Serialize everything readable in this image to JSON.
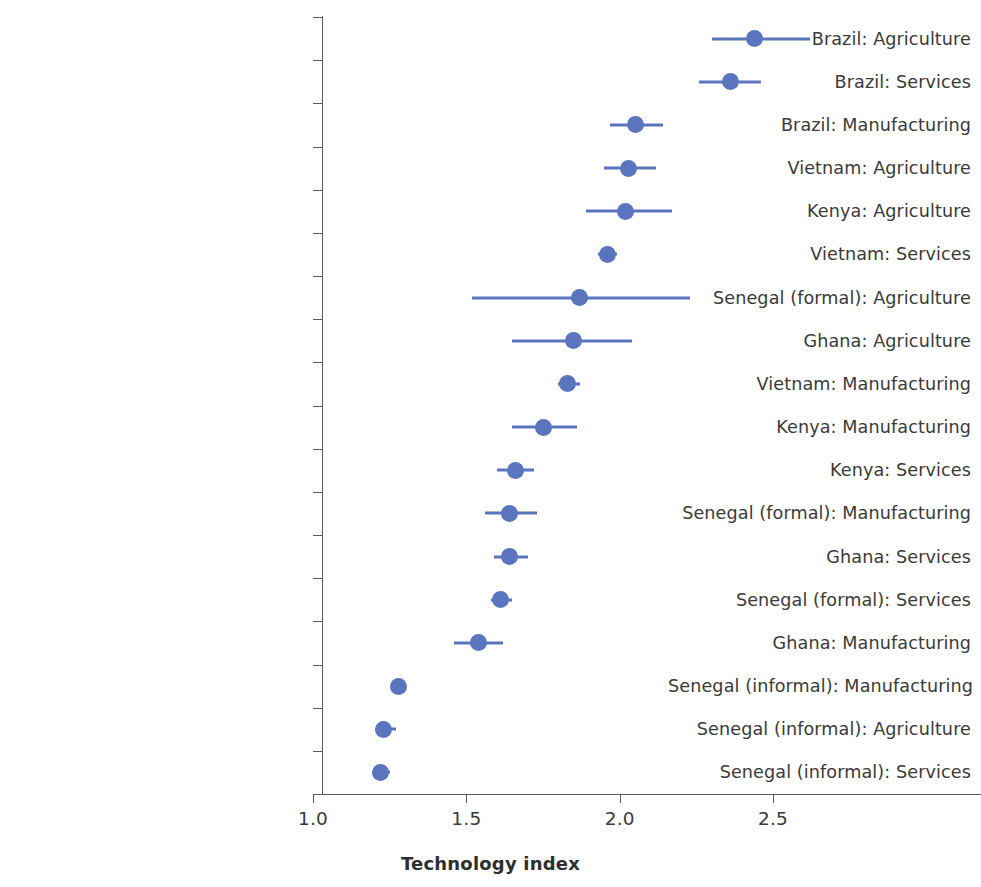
{
  "chart_data": {
    "type": "scatter",
    "subtype": "dot-plot-with-confidence-intervals",
    "title": "",
    "xlabel": "Technology index",
    "ylabel": "",
    "xlim": [
      1.0,
      2.7
    ],
    "x_ticks": [
      "1.0",
      "1.5",
      "2.0",
      "2.5"
    ],
    "x_tick_values": [
      1.0,
      1.5,
      2.0,
      2.5
    ],
    "grid": false,
    "legend": null,
    "marker_color": "#5a74bd",
    "line_color": "#5a74bd",
    "axis_color": "#5a5a5a",
    "sorted": "descending by estimate",
    "categories": [
      "Brazil: Agriculture",
      "Brazil: Services",
      "Brazil: Manufacturing",
      "Vietnam: Agriculture",
      "Kenya: Agriculture",
      "Vietnam: Services",
      "Senegal (formal): Agriculture",
      "Ghana: Agriculture",
      "Vietnam: Manufacturing",
      "Kenya: Manufacturing",
      "Kenya: Services",
      "Senegal (formal): Manufacturing",
      "Ghana: Services",
      "Senegal (formal): Services",
      "Ghana: Manufacturing",
      "Senegal (informal): Manufacturing",
      "Senegal (informal): Agriculture",
      "Senegal (informal): Services"
    ],
    "values": [
      2.44,
      2.36,
      2.05,
      2.03,
      2.02,
      1.96,
      1.87,
      1.85,
      1.83,
      1.75,
      1.66,
      1.64,
      1.64,
      1.61,
      1.54,
      1.28,
      1.23,
      1.22
    ],
    "ci_low": [
      2.3,
      2.26,
      1.97,
      1.95,
      1.89,
      1.93,
      1.52,
      1.65,
      1.8,
      1.65,
      1.6,
      1.56,
      1.59,
      1.58,
      1.46,
      1.28,
      1.21,
      1.21
    ],
    "ci_high": [
      2.62,
      2.46,
      2.14,
      2.12,
      2.17,
      1.99,
      2.23,
      2.04,
      1.87,
      1.86,
      1.72,
      1.73,
      1.7,
      1.65,
      1.62,
      1.28,
      1.27,
      1.25
    ],
    "points": [
      {
        "label": "Brazil: Agriculture",
        "value": 2.44,
        "ci_low": 2.3,
        "ci_high": 2.62
      },
      {
        "label": "Brazil: Services",
        "value": 2.36,
        "ci_low": 2.26,
        "ci_high": 2.46
      },
      {
        "label": "Brazil: Manufacturing",
        "value": 2.05,
        "ci_low": 1.97,
        "ci_high": 2.14
      },
      {
        "label": "Vietnam: Agriculture",
        "value": 2.03,
        "ci_low": 1.95,
        "ci_high": 2.12
      },
      {
        "label": "Kenya: Agriculture",
        "value": 2.02,
        "ci_low": 1.89,
        "ci_high": 2.17
      },
      {
        "label": "Vietnam: Services",
        "value": 1.96,
        "ci_low": 1.93,
        "ci_high": 1.99
      },
      {
        "label": "Senegal (formal): Agriculture",
        "value": 1.87,
        "ci_low": 1.52,
        "ci_high": 2.23
      },
      {
        "label": "Ghana: Agriculture",
        "value": 1.85,
        "ci_low": 1.65,
        "ci_high": 2.04
      },
      {
        "label": "Vietnam: Manufacturing",
        "value": 1.83,
        "ci_low": 1.8,
        "ci_high": 1.87
      },
      {
        "label": "Kenya: Manufacturing",
        "value": 1.75,
        "ci_low": 1.65,
        "ci_high": 1.86
      },
      {
        "label": "Kenya: Services",
        "value": 1.66,
        "ci_low": 1.6,
        "ci_high": 1.72
      },
      {
        "label": "Senegal (formal): Manufacturing",
        "value": 1.64,
        "ci_low": 1.56,
        "ci_high": 1.73
      },
      {
        "label": "Ghana: Services",
        "value": 1.64,
        "ci_low": 1.59,
        "ci_high": 1.7
      },
      {
        "label": "Senegal (formal): Services",
        "value": 1.61,
        "ci_low": 1.58,
        "ci_high": 1.65
      },
      {
        "label": "Ghana: Manufacturing",
        "value": 1.54,
        "ci_low": 1.46,
        "ci_high": 1.62
      },
      {
        "label": "Senegal (informal): Manufacturing",
        "value": 1.28,
        "ci_low": 1.28,
        "ci_high": 1.28
      },
      {
        "label": "Senegal (informal): Agriculture",
        "value": 1.23,
        "ci_low": 1.21,
        "ci_high": 1.27
      },
      {
        "label": "Senegal (informal): Services",
        "value": 1.22,
        "ci_low": 1.21,
        "ci_high": 1.25
      }
    ]
  },
  "axis": {
    "x_title": "Technology index",
    "ticks": [
      "1.0",
      "1.5",
      "2.0",
      "2.5"
    ]
  }
}
